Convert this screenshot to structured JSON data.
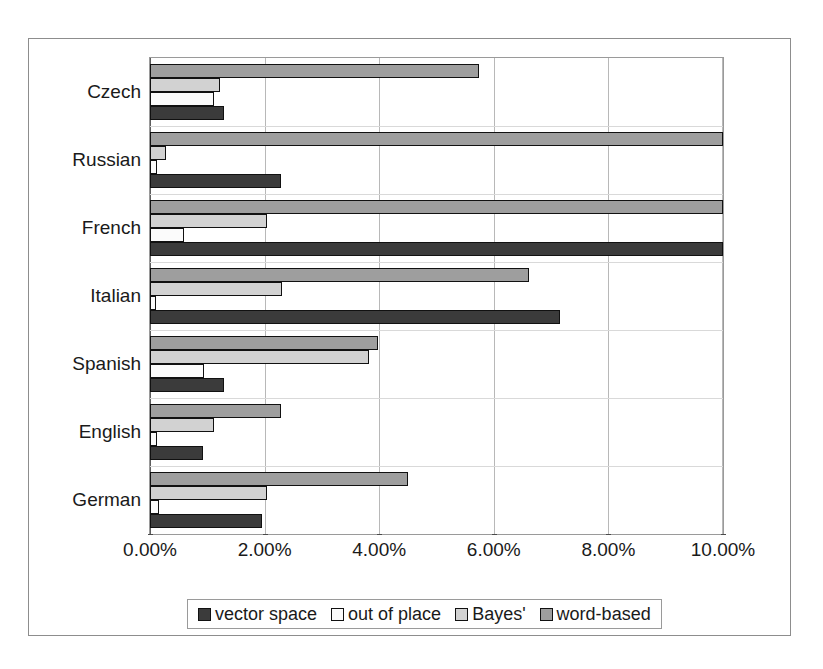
{
  "chart_data": {
    "type": "bar",
    "orientation": "horizontal",
    "title": "",
    "subtitle": "",
    "xlabel": "",
    "ylabel": "",
    "xlim": [
      0,
      10
    ],
    "xunit": "%",
    "grid": true,
    "legend_position": "bottom",
    "categories": [
      "Czech",
      "Russian",
      "French",
      "Italian",
      "Spanish",
      "English",
      "German"
    ],
    "xticks": [
      0,
      2,
      4,
      6,
      8,
      10
    ],
    "xtick_labels": [
      "0.00%",
      "2.00%",
      "4.00%",
      "6.00%",
      "8.00%",
      "10.00%"
    ],
    "series": [
      {
        "name": "vector space",
        "color": "#3b3b3b",
        "values": [
          1.3,
          2.28,
          10.0,
          7.15,
          1.3,
          0.92,
          1.95
        ]
      },
      {
        "name": "out of place",
        "color": "#fbfbfb",
        "values": [
          1.12,
          0.12,
          0.6,
          0.1,
          0.95,
          0.12,
          0.15
        ]
      },
      {
        "name": "Bayes'",
        "color": "#d2d2d2",
        "values": [
          1.22,
          0.28,
          2.05,
          2.3,
          3.82,
          1.12,
          2.05
        ]
      },
      {
        "name": "word-based",
        "color": "#9e9e9e",
        "values": [
          5.75,
          10.0,
          10.0,
          6.62,
          3.98,
          2.28,
          4.5
        ]
      }
    ],
    "series_draw_order_top_to_bottom": [
      "word-based",
      "Bayes'",
      "out of place",
      "vector space"
    ]
  },
  "legend": {
    "items": [
      {
        "label": "vector space",
        "swatch": "#3b3b3b",
        "icon": "legend-swatch-icon"
      },
      {
        "label": "out of place",
        "swatch": "#fbfbfb",
        "icon": "legend-swatch-icon"
      },
      {
        "label": "Bayes'",
        "swatch": "#d2d2d2",
        "icon": "legend-swatch-icon"
      },
      {
        "label": "word-based",
        "swatch": "#9e9e9e",
        "icon": "legend-swatch-icon"
      }
    ]
  }
}
